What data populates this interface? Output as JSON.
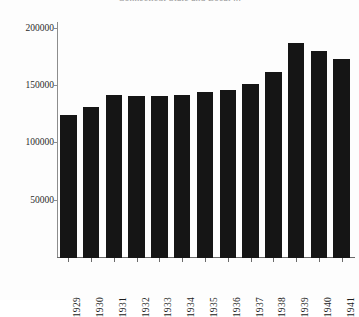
{
  "chart_data": {
    "type": "bar",
    "title": "Connecticut State and Local ...",
    "xlabel": "",
    "ylabel": "",
    "categories": [
      "1929",
      "1930",
      "1931",
      "1932",
      "1933",
      "1934",
      "1935",
      "1936",
      "1937",
      "1938",
      "1939",
      "1940",
      "1941"
    ],
    "values": [
      125000,
      132000,
      142000,
      141000,
      141000,
      142000,
      145000,
      147000,
      152000,
      162000,
      188000,
      181000,
      174000
    ],
    "ylim": [
      0,
      205000
    ],
    "yticks": [
      50000,
      100000,
      150000,
      200000
    ],
    "ytick_labels": [
      "50000",
      "100000",
      "150000",
      "200000"
    ],
    "grid": false,
    "legend": null,
    "bar_color": "#151515",
    "axis_color": "#6a6a6a",
    "background": "#ffffff"
  },
  "figure": {
    "width": 359,
    "height": 300
  }
}
